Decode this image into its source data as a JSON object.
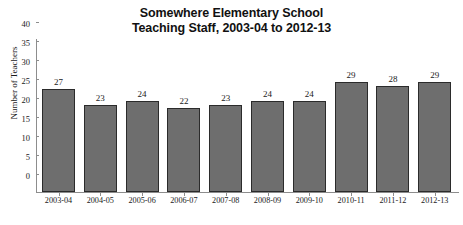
{
  "chart_data": {
    "type": "bar",
    "title": "Somewhere Elementary School Teaching Staff, 2003-04 to 2012-13",
    "title_line1": "Somewhere Elementary School",
    "title_line2": "Teaching Staff, 2003-04 to 2012-13",
    "xlabel": "",
    "ylabel": "Number of Teachers",
    "categories": [
      "2003-04",
      "2004-05",
      "2005-06",
      "2006-07",
      "2007-08",
      "2008-09",
      "2009-10",
      "2010-11",
      "2011-12",
      "2012-13"
    ],
    "values": [
      27,
      23,
      24,
      22,
      23,
      24,
      24,
      29,
      28,
      29
    ],
    "ylim": [
      0,
      40
    ],
    "yticks": [
      0,
      5,
      10,
      15,
      20,
      25,
      30,
      35,
      40
    ],
    "grid": false,
    "legend": false,
    "data_labels": true,
    "bar_color": "#6e6e6e",
    "bar_edge_color": "#2b2b2b",
    "background_color": "#ffffff",
    "axis_color": "#8d8d8d",
    "text_color": "#1a1a1a"
  }
}
